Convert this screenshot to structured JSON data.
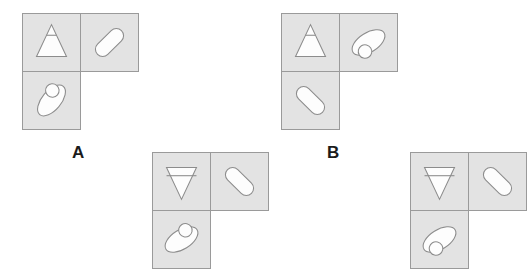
{
  "canvas": {
    "width": 487,
    "height": 273,
    "background": "#ffffff"
  },
  "style": {
    "cell_fill": "#e3e3e3",
    "cell_border": "#9a9a9a",
    "shape_fill": "#fdfdfd",
    "shape_stroke": "#8c8c8c",
    "label_color": "#1b1b1b"
  },
  "puzzle": {
    "kind": "shape-tile-figure-options",
    "cell_size": 59,
    "shape_names": {
      "triangle_up": "triangle-up",
      "triangle_down": "triangle-down",
      "ellipse_with_circle": "ellipse-with-circle",
      "rounded_rect": "rounded-rectangle"
    }
  },
  "groups": [
    {
      "id": "group-a",
      "label": "A",
      "label_visible": true,
      "label_x": 72,
      "label_y": 144,
      "x": 22,
      "y": 13,
      "cells": [
        {
          "name": "cell-top-left",
          "col": 0,
          "row": 0,
          "shape": "triangle_up",
          "rotation": 0
        },
        {
          "name": "cell-top-right",
          "col": 1,
          "row": 0,
          "shape": "rounded_rect",
          "rotation": -45
        },
        {
          "name": "cell-bottom-left",
          "col": 0,
          "row": 1,
          "shape": "ellipse_with_circle",
          "rotation": -50,
          "circle_position": "upper-right"
        }
      ]
    },
    {
      "id": "group-b",
      "label": "B",
      "label_visible": true,
      "label_x": 327,
      "label_y": 144,
      "x": 281,
      "y": 13,
      "cells": [
        {
          "name": "cell-top-left",
          "col": 0,
          "row": 0,
          "shape": "triangle_up",
          "rotation": 0
        },
        {
          "name": "cell-top-right",
          "col": 1,
          "row": 0,
          "shape": "ellipse_with_circle",
          "rotation": -32,
          "circle_position": "lower-left"
        },
        {
          "name": "cell-bottom-left",
          "col": 0,
          "row": 1,
          "shape": "rounded_rect",
          "rotation": 45
        }
      ]
    },
    {
      "id": "group-c",
      "label": "",
      "label_visible": false,
      "label_x": 0,
      "label_y": 0,
      "x": 152,
      "y": 152,
      "cells": [
        {
          "name": "cell-top-left",
          "col": 0,
          "row": 0,
          "shape": "triangle_down",
          "rotation": 0
        },
        {
          "name": "cell-top-right",
          "col": 1,
          "row": 0,
          "shape": "rounded_rect",
          "rotation": 45
        },
        {
          "name": "cell-bottom-left",
          "col": 0,
          "row": 1,
          "shape": "ellipse_with_circle",
          "rotation": -32,
          "circle_position": "upper-right"
        }
      ]
    },
    {
      "id": "group-d",
      "label": "",
      "label_visible": false,
      "label_x": 0,
      "label_y": 0,
      "x": 410,
      "y": 152,
      "cells": [
        {
          "name": "cell-top-left",
          "col": 0,
          "row": 0,
          "shape": "triangle_down",
          "rotation": 0
        },
        {
          "name": "cell-top-right",
          "col": 1,
          "row": 0,
          "shape": "rounded_rect",
          "rotation": 45
        },
        {
          "name": "cell-bottom-left",
          "col": 0,
          "row": 1,
          "shape": "ellipse_with_circle",
          "rotation": -32,
          "circle_position": "lower-left"
        }
      ]
    }
  ]
}
